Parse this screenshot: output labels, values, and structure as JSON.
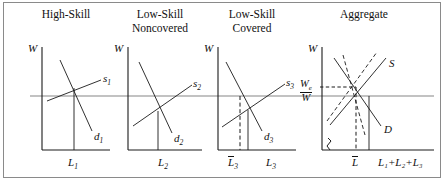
{
  "figure": {
    "title": "",
    "panels": [
      {
        "id": "high-skill",
        "title": "High-Skill",
        "title_line2": "",
        "y_axis_label": "W",
        "x_axis_label": "L",
        "x_axis_sub": "1",
        "supply_label": "s",
        "supply_sub": "1",
        "demand_label": "d",
        "demand_sub": "1",
        "equilibrium_above_wbar": true,
        "has_dashed_quantity": false
      },
      {
        "id": "low-skill-noncovered",
        "title": "Low-Skill",
        "title_line2": "Noncovered",
        "y_axis_label": "W",
        "x_axis_label": "L",
        "x_axis_sub": "2",
        "supply_label": "s",
        "supply_sub": "2",
        "demand_label": "d",
        "demand_sub": "2",
        "equilibrium_above_wbar": false,
        "has_dashed_quantity": false
      },
      {
        "id": "low-skill-covered",
        "title": "Low-Skill",
        "title_line2": "Covered",
        "y_axis_label": "W",
        "x_axis_label": "L",
        "x_axis_sub": "3",
        "x_axis_label_bar": "L",
        "x_axis_bar_sub": "3",
        "supply_label": "s",
        "supply_sub": "3",
        "demand_label": "d",
        "demand_sub": "3",
        "equilibrium_above_wbar": false,
        "has_dashed_quantity": true
      },
      {
        "id": "aggregate",
        "title": "Aggregate",
        "title_line2": "",
        "y_axis_label": "W",
        "x_axis_label": "L₁+L₂+L₃",
        "x_axis_label_bar": "L",
        "wage_equilibrium_label": "W",
        "wage_equilibrium_sub": "e",
        "wage_minimum_label": "W",
        "supply_label": "S",
        "demand_label": "D",
        "has_axis_break": true,
        "has_dashed_curves": true
      }
    ],
    "shared": {
      "minimum_wage_line_label": "W-bar horizontal line",
      "line_color": "#1a1a1a",
      "frame_color": "#8a8a8a",
      "background": "#ffffff"
    }
  }
}
